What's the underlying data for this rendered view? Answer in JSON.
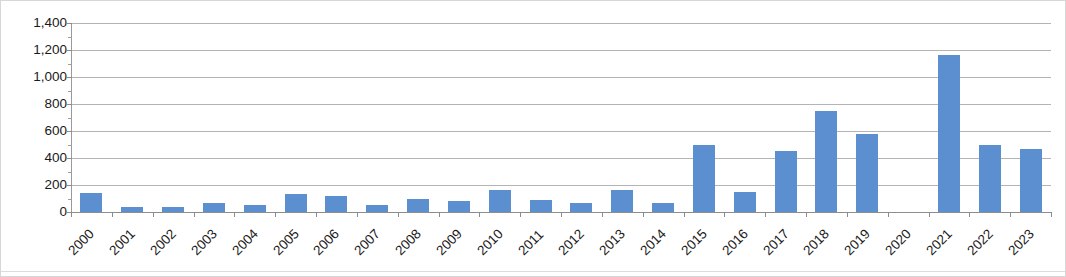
{
  "chart_data": {
    "type": "bar",
    "title": "",
    "subtitle": "",
    "xlabel": "",
    "ylabel": "",
    "categories": [
      "2000",
      "2001",
      "2002",
      "2003",
      "2004",
      "2005",
      "2006",
      "2007",
      "2008",
      "2009",
      "2010",
      "2011",
      "2012",
      "2013",
      "2014",
      "2015",
      "2016",
      "2017",
      "2018",
      "2019",
      "2020",
      "2021",
      "2022",
      "2023"
    ],
    "values": [
      140,
      35,
      35,
      65,
      50,
      130,
      115,
      55,
      100,
      80,
      160,
      90,
      70,
      165,
      70,
      500,
      145,
      455,
      750,
      580,
      0,
      1160,
      500,
      465
    ],
    "series": [
      {
        "name": "",
        "values": [
          140,
          35,
          35,
          65,
          50,
          130,
          115,
          55,
          100,
          80,
          160,
          90,
          70,
          165,
          70,
          500,
          145,
          455,
          750,
          580,
          0,
          1160,
          500,
          465
        ]
      }
    ],
    "ylim": [
      0,
      1400
    ],
    "ytick_step": 200,
    "ytick_labels": [
      "0",
      "200",
      "400",
      "600",
      "800",
      "1,000",
      "1,200",
      "1,400"
    ],
    "ytick_values": [
      0,
      200,
      400,
      600,
      800,
      1000,
      1200,
      1400
    ],
    "grid": true,
    "grid_axis": "y",
    "legend": false,
    "legend_position": "none",
    "bar_color": "#5b8fd0",
    "gridline_color": "#b4b4b4",
    "axis_color": "#8d8d8d",
    "xtick_rotation": -45,
    "annotations": []
  }
}
